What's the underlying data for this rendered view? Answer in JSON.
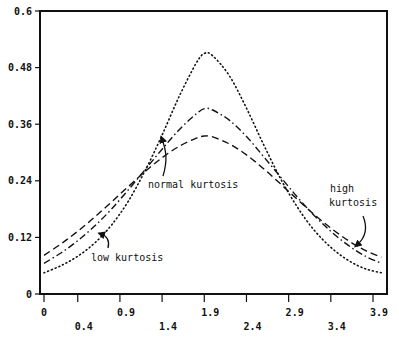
{
  "chart_data": {
    "type": "line",
    "title": "",
    "xlabel": "",
    "ylabel": "",
    "xlim": [
      0,
      4.1
    ],
    "ylim": [
      0,
      0.6
    ],
    "grid": false,
    "x_ticks": [
      "0",
      "0.4",
      "0.9",
      "1.4",
      "1.9",
      "2.4",
      "2.9",
      "3.4",
      "3.9"
    ],
    "x_tick_values": [
      0,
      0.4,
      0.9,
      1.4,
      1.9,
      2.4,
      2.9,
      3.4,
      3.9
    ],
    "y_ticks": [
      "0",
      "0.12",
      "0.24",
      "0.36",
      "0.48",
      "0.6"
    ],
    "y_tick_values": [
      0,
      0.12,
      0.24,
      0.36,
      0.48,
      0.6
    ],
    "x": [
      0,
      0.2,
      0.4,
      0.6,
      0.8,
      1.0,
      1.2,
      1.4,
      1.6,
      1.8,
      1.9,
      2.0,
      2.2,
      2.4,
      2.6,
      2.8,
      3.0,
      3.2,
      3.4,
      3.6,
      3.8,
      4.0
    ],
    "series": [
      {
        "name": "high kurtosis",
        "style": "dotted",
        "values": [
          0.045,
          0.06,
          0.08,
          0.108,
          0.146,
          0.197,
          0.262,
          0.337,
          0.418,
          0.488,
          0.51,
          0.505,
          0.462,
          0.394,
          0.318,
          0.246,
          0.185,
          0.136,
          0.099,
          0.072,
          0.054,
          0.045
        ]
      },
      {
        "name": "normal kurtosis",
        "style": "dash-dot",
        "values": [
          0.065,
          0.087,
          0.113,
          0.144,
          0.18,
          0.221,
          0.264,
          0.307,
          0.348,
          0.381,
          0.393,
          0.39,
          0.368,
          0.334,
          0.292,
          0.249,
          0.206,
          0.167,
          0.133,
          0.104,
          0.081,
          0.065
        ]
      },
      {
        "name": "low kurtosis",
        "style": "dashed",
        "values": [
          0.082,
          0.106,
          0.133,
          0.163,
          0.195,
          0.228,
          0.26,
          0.289,
          0.313,
          0.33,
          0.335,
          0.333,
          0.318,
          0.295,
          0.266,
          0.234,
          0.201,
          0.169,
          0.14,
          0.114,
          0.093,
          0.078
        ]
      }
    ],
    "annotations": [
      {
        "text": "normal kurtosis",
        "target_series": "normal kurtosis",
        "x": 1.5,
        "y": 0.23,
        "arrow_to": [
          1.07,
          0.335
        ]
      },
      {
        "text": "low kurtosis",
        "target_series": "low kurtosis",
        "x": 0.65,
        "y": 0.09,
        "arrow_to": [
          0.6,
          0.11
        ]
      },
      {
        "text": "high kurtosis",
        "target_series": "high kurtosis",
        "x": 3.5,
        "y": 0.22,
        "arrow_to": [
          3.7,
          0.118
        ]
      }
    ],
    "legend": "none"
  }
}
